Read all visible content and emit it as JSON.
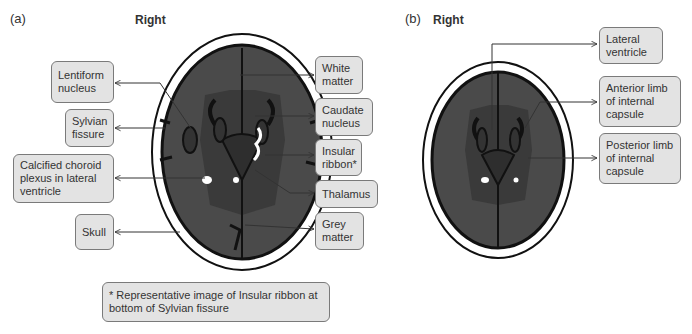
{
  "panel_a": {
    "panel_label": "(a)",
    "orientation_label": "Right",
    "labels_left": [
      {
        "text": "Lentiform nucleus"
      },
      {
        "text": "Sylvian fissure"
      },
      {
        "text": "Calcified choroid plexus in lateral ventricle"
      },
      {
        "text": "Skull"
      }
    ],
    "labels_right": [
      {
        "text": "White matter"
      },
      {
        "text": "Caudate nucleus"
      },
      {
        "text": "Insular ribbon*"
      },
      {
        "text": "Thalamus"
      },
      {
        "text": "Grey matter"
      }
    ],
    "footnote": "* Representative image of Insular ribbon at bottom of Sylvian fissure"
  },
  "panel_b": {
    "panel_label": "(b)",
    "orientation_label": "Right",
    "labels_right": [
      {
        "text": "Lateral ventricle"
      },
      {
        "text": "Anterior limb of internal capsule"
      },
      {
        "text": "Posterior limb of internal capsule"
      }
    ]
  },
  "colors": {
    "skull": "#ffffff",
    "grey_matter": "#4a4a4a",
    "white_matter_region": "#3a3a3a",
    "label_box_bg": "#e3e3e3",
    "label_box_border": "#7a7a7a",
    "sulci": "#111111",
    "calcification": "#ffffff"
  }
}
